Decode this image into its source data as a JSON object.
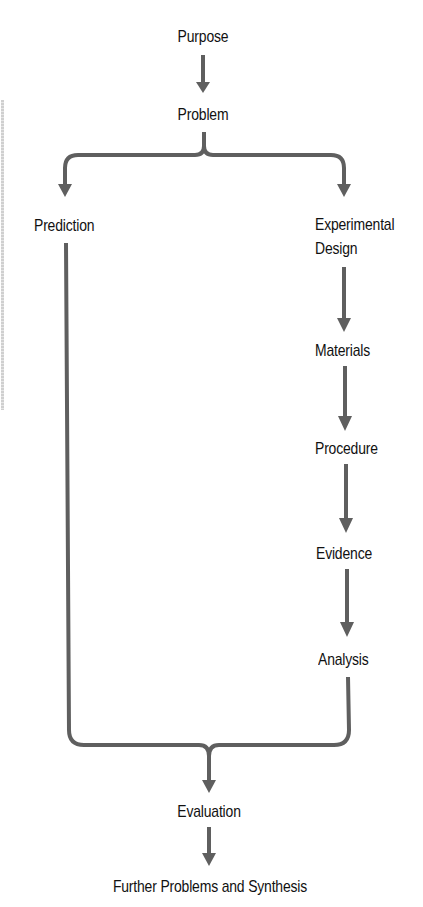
{
  "diagram": {
    "type": "flowchart",
    "colors": {
      "arrow": "#5f5f5f",
      "text": "#111111",
      "background": "#ffffff"
    },
    "nodes": {
      "purpose": "Purpose",
      "problem": "Problem",
      "prediction": "Prediction",
      "experimental_design_line1": "Experimental",
      "experimental_design_line2": "Design",
      "materials": "Materials",
      "procedure": "Procedure",
      "evidence": "Evidence",
      "analysis": "Analysis",
      "evaluation": "Evaluation",
      "further": "Further Problems and Synthesis"
    },
    "edges": [
      {
        "from": "Purpose",
        "to": "Problem"
      },
      {
        "from": "Problem",
        "to": "Prediction",
        "style": "brace-split"
      },
      {
        "from": "Problem",
        "to": "Experimental Design",
        "style": "brace-split"
      },
      {
        "from": "Experimental Design",
        "to": "Materials"
      },
      {
        "from": "Materials",
        "to": "Procedure"
      },
      {
        "from": "Procedure",
        "to": "Evidence"
      },
      {
        "from": "Evidence",
        "to": "Analysis"
      },
      {
        "from": "Prediction",
        "to": "Evaluation",
        "style": "brace-merge"
      },
      {
        "from": "Analysis",
        "to": "Evaluation",
        "style": "brace-merge"
      },
      {
        "from": "Evaluation",
        "to": "Further Problems and Synthesis"
      }
    ]
  }
}
